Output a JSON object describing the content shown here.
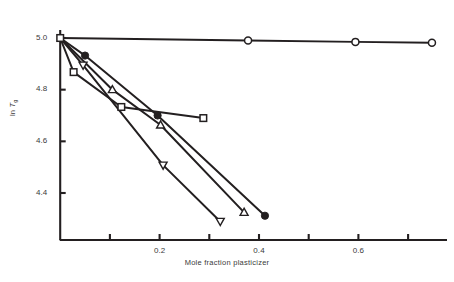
{
  "chart_data": {
    "type": "line",
    "title": "",
    "subtitle": "",
    "xlabel": "Mole fraction plasticizer",
    "ylabel_prefix": "ln ",
    "ylabel_symbol": "T",
    "ylabel_subscript": "g",
    "ylabel_full": "ln Tg",
    "xlim": [
      0.0,
      0.79
    ],
    "ylim": [
      4.28,
      5.02
    ],
    "grid": false,
    "legend": "none",
    "xticks_major": [
      0.2,
      0.4,
      0.6
    ],
    "xticks_major_labels": [
      "0.2",
      "0.4",
      "0.6"
    ],
    "xticks_minor": [
      0.1,
      0.3,
      0.5,
      0.7
    ],
    "yticks_major": [
      5.0,
      4.8,
      4.6,
      4.4
    ],
    "yticks_major_labels": [
      "5.0",
      "4.8",
      "4.6",
      "4.4"
    ],
    "series": [
      {
        "name": "open-circle-series",
        "marker": "circle-open",
        "filled": false,
        "points": [
          {
            "x": 0.0,
            "y": 5.0
          },
          {
            "x": 0.378,
            "y": 4.99
          },
          {
            "x": 0.594,
            "y": 4.985
          },
          {
            "x": 0.748,
            "y": 4.982
          }
        ]
      },
      {
        "name": "filled-circle-series",
        "marker": "circle-filled",
        "filled": true,
        "points": [
          {
            "x": 0.0,
            "y": 5.0
          },
          {
            "x": 0.05,
            "y": 4.932
          },
          {
            "x": 0.196,
            "y": 4.7
          },
          {
            "x": 0.412,
            "y": 4.312
          }
        ]
      },
      {
        "name": "open-square-series",
        "marker": "square-open",
        "filled": false,
        "points": [
          {
            "x": 0.0,
            "y": 5.0
          },
          {
            "x": 0.027,
            "y": 4.868
          },
          {
            "x": 0.123,
            "y": 4.733
          },
          {
            "x": 0.288,
            "y": 4.69
          }
        ]
      },
      {
        "name": "open-triangle-up-series",
        "marker": "triangle-up-open",
        "filled": false,
        "points": [
          {
            "x": 0.0,
            "y": 5.0
          },
          {
            "x": 0.105,
            "y": 4.8
          },
          {
            "x": 0.202,
            "y": 4.663
          },
          {
            "x": 0.37,
            "y": 4.325
          }
        ]
      },
      {
        "name": "open-triangle-down-series",
        "marker": "triangle-down-open",
        "filled": false,
        "points": [
          {
            "x": 0.0,
            "y": 5.0
          },
          {
            "x": 0.046,
            "y": 4.895
          },
          {
            "x": 0.207,
            "y": 4.508
          },
          {
            "x": 0.322,
            "y": 4.29
          }
        ]
      }
    ],
    "colors": {
      "axis": "#231f20",
      "line": "#231f20",
      "marker_fill": "#231f20",
      "marker_open_fill": "#ffffff",
      "text": "#3a3a3a",
      "background": "#ffffff"
    }
  }
}
